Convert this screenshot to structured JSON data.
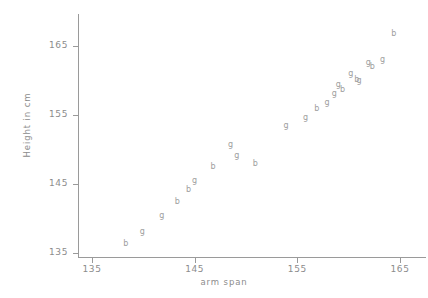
{
  "chart_data": {
    "type": "scatter",
    "title": "",
    "xlabel": "arm span",
    "ylabel": "Height in cm",
    "xlim": [
      133.5,
      166.5
    ],
    "ylim": [
      133.5,
      168.5
    ],
    "xticks": [
      135,
      145,
      155,
      165
    ],
    "yticks": [
      135,
      145,
      155,
      165
    ],
    "xtick_labels": [
      "135",
      "145",
      "155",
      "165"
    ],
    "ytick_labels": [
      "135",
      "145",
      "155",
      "165"
    ],
    "grid": false,
    "legend": "none",
    "marker_style": "letter",
    "series": [
      {
        "name": "b",
        "marker_label": "b",
        "points": [
          {
            "x": 138.3,
            "y": 136.3
          },
          {
            "x": 143.3,
            "y": 142.4
          },
          {
            "x": 144.4,
            "y": 144.1
          },
          {
            "x": 146.8,
            "y": 147.4
          },
          {
            "x": 150.9,
            "y": 147.9
          },
          {
            "x": 156.9,
            "y": 155.8
          },
          {
            "x": 159.4,
            "y": 158.6
          },
          {
            "x": 160.8,
            "y": 160.1
          },
          {
            "x": 162.3,
            "y": 161.9
          },
          {
            "x": 164.4,
            "y": 166.8
          }
        ]
      },
      {
        "name": "g",
        "marker_label": "g",
        "points": [
          {
            "x": 139.9,
            "y": 138.1
          },
          {
            "x": 141.8,
            "y": 140.3
          },
          {
            "x": 145.0,
            "y": 145.4
          },
          {
            "x": 148.5,
            "y": 150.6
          },
          {
            "x": 149.1,
            "y": 149.0
          },
          {
            "x": 153.9,
            "y": 153.4
          },
          {
            "x": 155.8,
            "y": 154.6
          },
          {
            "x": 157.9,
            "y": 156.8
          },
          {
            "x": 158.6,
            "y": 158.1
          },
          {
            "x": 159.0,
            "y": 159.4
          },
          {
            "x": 160.2,
            "y": 160.9
          },
          {
            "x": 161.0,
            "y": 159.9
          },
          {
            "x": 161.9,
            "y": 162.5
          },
          {
            "x": 163.3,
            "y": 162.9
          }
        ]
      }
    ]
  }
}
